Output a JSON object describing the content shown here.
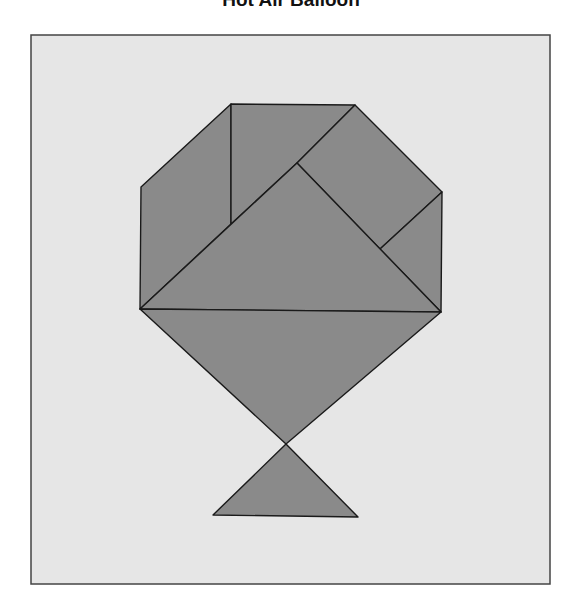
{
  "title": "Hot Air Balloon",
  "colors": {
    "background": "#ffffff",
    "panel": "#e6e6e6",
    "panel_border": "#444444",
    "shape_fill": "#8a8a8a",
    "shape_stroke": "#1a1a1a"
  },
  "panel": {
    "x": 31,
    "y": 35,
    "width": 519,
    "height": 549
  },
  "pieces": [
    {
      "name": "left-trapezoid-piece",
      "points": "141,187 231,104 231,224 140,309"
    },
    {
      "name": "top-square-piece",
      "points": "231,104 355,105 297,163 231,224"
    },
    {
      "name": "top-right-parallelogram-piece",
      "points": "355,105 442,192 380,249 297,163"
    },
    {
      "name": "right-small-triangle-piece",
      "points": "442,192 441,312 380,249"
    },
    {
      "name": "center-large-triangle-piece",
      "points": "297,163 441,312 140,309"
    },
    {
      "name": "lower-large-triangle-piece",
      "points": "140,309 441,312 286,444"
    },
    {
      "name": "basket-triangle-piece",
      "points": "286,444 358,517 213,515"
    }
  ]
}
